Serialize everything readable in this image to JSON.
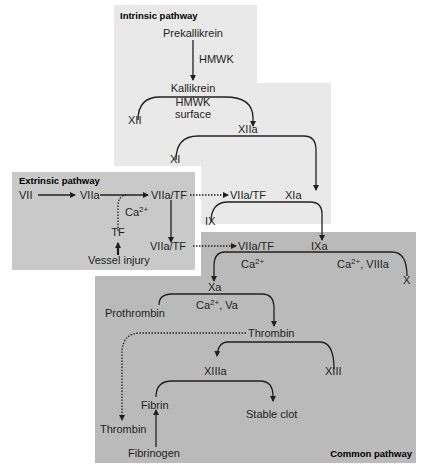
{
  "panels": {
    "intrinsic": {
      "title": "Intrinsic pathway",
      "color": "#e9e9e9"
    },
    "extrinsic": {
      "title": "Extrinsic pathway",
      "color": "#c9c9c9"
    },
    "common": {
      "title": "Common pathway",
      "color": "#bababa"
    }
  },
  "labels": {
    "prekallikrein": "Prekallikrein",
    "hmwk1": "HMWK",
    "kallikrein": "Kallikrein",
    "hmwk2": "HMWK",
    "surface": "surface",
    "xii": "XII",
    "xiia": "XIIa",
    "xi": "XI",
    "xia": "XIa",
    "ix": "IX",
    "vii": "VII",
    "viia": "VIIa",
    "viia_tf_1": "VIIa/TF",
    "viia_tf_2": "VIIa/TF",
    "viia_tf_3": "VIIa/TF",
    "viia_tf_4": "VIIa/TF",
    "ca_ext": "Ca",
    "tf": "TF",
    "vessel_injury": "Vessel injury",
    "ixa": "IXa",
    "ca_left": "Ca",
    "ca_right": "Ca",
    "viiia": ", VIIIa",
    "x": "X",
    "xa": "Xa",
    "prothrombin": "Prothrombin",
    "ca_va": "Ca",
    "va": ", Va",
    "thrombin": "Thrombin",
    "xiiia": "XIIIa",
    "xiii": "XIII",
    "fibrin": "Fibrin",
    "stable_clot": "Stable clot",
    "thrombin2": "Thrombin",
    "fibrinogen": "Fibrinogen",
    "sup": "2+"
  }
}
